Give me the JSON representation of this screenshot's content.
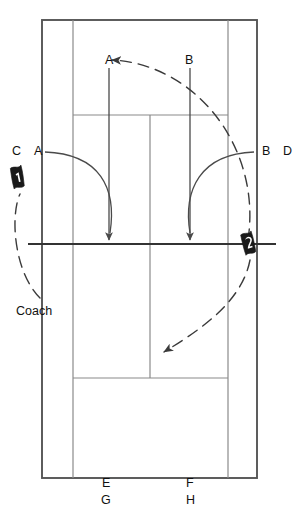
{
  "diagram": {
    "colors": {
      "line": "#3a3a3a",
      "line_bold": "#2b2b2b",
      "arrow": "#4a4a4a",
      "text": "#111111",
      "marker_fill": "#1a1a1a",
      "marker_text": "#ffffff",
      "background": "#ffffff"
    },
    "court": {
      "outer_left": 42,
      "outer_right": 257,
      "outer_top": 20,
      "outer_bottom": 478,
      "singles_left": 73,
      "singles_right": 228,
      "service_line_top": 115,
      "service_line_bottom": 378,
      "center_line_x": 150,
      "net_y": 244,
      "net_extend_left": 28,
      "net_extend_right": 276
    },
    "labels": [
      {
        "name": "label-a-top",
        "text": "A",
        "x": 105,
        "y": 54
      },
      {
        "name": "label-b-top",
        "text": "B",
        "x": 185,
        "y": 54
      },
      {
        "name": "label-c-left",
        "text": "C",
        "x": 12,
        "y": 145
      },
      {
        "name": "label-a-left",
        "text": "A",
        "x": 34,
        "y": 145
      },
      {
        "name": "label-b-right",
        "text": "B",
        "x": 262,
        "y": 145
      },
      {
        "name": "label-d-right",
        "text": "D",
        "x": 283,
        "y": 145
      },
      {
        "name": "label-coach",
        "text": "Coach",
        "x": 16,
        "y": 305
      },
      {
        "name": "label-e-bottom",
        "text": "E",
        "x": 102,
        "y": 477
      },
      {
        "name": "label-f-bottom",
        "text": "F",
        "x": 186,
        "y": 477
      },
      {
        "name": "label-g-bottom",
        "text": "G",
        "x": 101,
        "y": 494
      },
      {
        "name": "label-h-bottom",
        "text": "H",
        "x": 186,
        "y": 494
      }
    ],
    "markers": [
      {
        "name": "player-marker-1",
        "number": "1",
        "x": 18,
        "y": 178
      },
      {
        "name": "player-marker-2",
        "number": "2",
        "x": 249,
        "y": 244
      }
    ],
    "arrows": {
      "straight": [
        {
          "name": "arrow-a-down",
          "x": 109,
          "y1": 68,
          "y2": 243
        },
        {
          "name": "arrow-b-down",
          "x": 190,
          "y1": 68,
          "y2": 243
        }
      ],
      "curved_solid": [
        {
          "name": "arc-a-serve",
          "path": "M 45 152 C 100 155 115 190 110 232"
        },
        {
          "name": "arc-b-serve",
          "path": "M 254 152 C 200 155 186 192 190 232"
        }
      ],
      "curved_dashed": [
        {
          "name": "arc-coach-to-marker1",
          "path": "M 39 296 C 12 270 12 215 20 192"
        },
        {
          "name": "arc-ball-over-net",
          "path": "M 247 243 C 255 150 190 68 115 62"
        },
        {
          "name": "arc-marker2-return",
          "path": "M 249 258 C 240 300 200 330 166 353"
        }
      ]
    }
  }
}
